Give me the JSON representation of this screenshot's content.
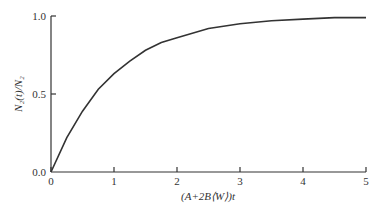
{
  "chart_data": {
    "type": "line",
    "title": "",
    "xlabel": "(A+2B⟨W⟩)t",
    "ylabel": "N₂(t)/N₂",
    "xlim": [
      0,
      5
    ],
    "ylim": [
      0,
      1.0
    ],
    "x_ticks": [
      "0",
      "1",
      "2",
      "3",
      "4",
      "5"
    ],
    "y_ticks": [
      "0.0",
      "0.5",
      "1.0"
    ],
    "grid": false,
    "legend": null,
    "series": [
      {
        "name": "N2(t)/N2 = 1 - exp(-(A+2B<W>)t)",
        "x": [
          0,
          0.25,
          0.5,
          0.75,
          1.0,
          1.25,
          1.5,
          1.75,
          2.0,
          2.5,
          3.0,
          3.5,
          4.0,
          4.5,
          5.0
        ],
        "values": [
          0.0,
          0.22,
          0.39,
          0.53,
          0.63,
          0.71,
          0.78,
          0.83,
          0.86,
          0.92,
          0.95,
          0.97,
          0.98,
          0.99,
          0.99
        ]
      }
    ]
  },
  "colors": {
    "line": "#333333",
    "axis": "#333333",
    "background": "#ffffff"
  }
}
